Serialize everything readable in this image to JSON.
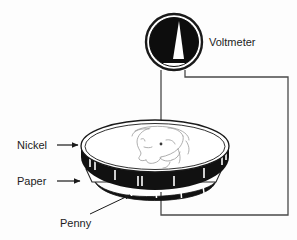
{
  "figure": {
    "background_color": "#fdfdfd",
    "ink_color": "#1a1a1a"
  },
  "labels": {
    "voltmeter": "Voltmeter",
    "nickel": "Nickel",
    "paper": "Paper",
    "penny": "Penny"
  },
  "components": {
    "voltmeter": {
      "name": "voltmeter",
      "shape": "circle-dial",
      "dial_fill": "#0d0d0d",
      "needle_fill": "#ffffff",
      "center_x": 174,
      "center_y": 42,
      "radius": 29
    },
    "nickel": {
      "name": "nickel",
      "shape": "disc-top-face",
      "face_fill": "#ffffff",
      "edge_fill": "#101010",
      "engraving": "jefferson-profile-outline"
    },
    "paper": {
      "name": "paper",
      "shape": "thin-sheet",
      "fill": "#ffffff"
    },
    "penny": {
      "name": "penny",
      "shape": "disc-edge-arc",
      "edge_fill": "#101010"
    },
    "wires": {
      "name": "circuit-wires",
      "stroke": "#3a3a3a",
      "left_lead": "voltmeter-to-nickel-top",
      "right_lead": "voltmeter-around-right-to-penny"
    }
  },
  "leader_lines": {
    "nickel_arrow": "horizontal-arrow-right",
    "paper_arrow": "horizontal-arrow-right",
    "penny_arrow": "diagonal-arrow-up-right"
  }
}
